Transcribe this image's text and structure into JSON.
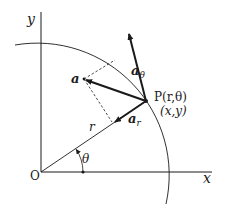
{
  "diagram": {
    "labels": {
      "y_axis": "y",
      "x_axis": "x",
      "origin": "O",
      "radius": "r",
      "angle": "θ",
      "point_name": "P(r,θ)",
      "point_cartesian": "(x,y)",
      "vector_a": "a",
      "vector_a_theta_base": "a",
      "vector_a_theta_sub": "θ",
      "vector_a_r_base": "a",
      "vector_a_r_sub": "r"
    },
    "colors": {
      "ink": "#1a1a1a",
      "background": "#ffffff"
    }
  }
}
